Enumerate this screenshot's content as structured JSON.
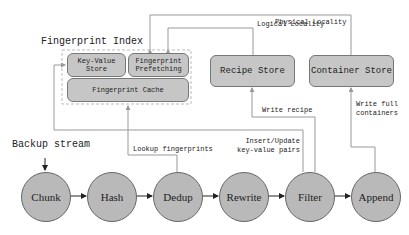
{
  "title": "Fingerprint Index",
  "index_components": {
    "key_value_store": "Key-Value\nStore",
    "prefetching": "Fingerprint\nPrefetching",
    "cache": "Fingerprint Cache"
  },
  "stores": {
    "recipe": "Recipe Store",
    "container": "Container Store"
  },
  "input_label": "Backup stream",
  "pipeline": [
    "Chunk",
    "Hash",
    "Dedup",
    "Rewrite",
    "Filter",
    "Append"
  ],
  "edge_labels": {
    "logical": "Logical Locality",
    "physical": "Physical Locality",
    "lookup": "Lookup fingerprints",
    "insert": "Insert/Update\nkey-value pairs",
    "write_recipe": "Write recipe",
    "write_containers": "Write full\ncontainers"
  },
  "colors": {
    "node_fill": "#b9b9b9",
    "box_fill": "#c6c6c6",
    "line": "#999999",
    "arrow": "#222222"
  }
}
